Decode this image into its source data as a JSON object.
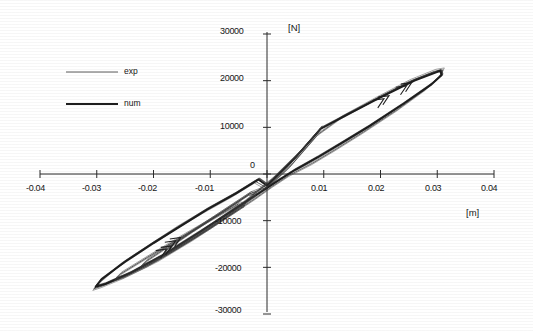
{
  "chart_data": {
    "type": "line",
    "title": "",
    "subtitle": "",
    "xlabel": "[m]",
    "ylabel": "[N]",
    "xlim": [
      -0.04,
      0.04
    ],
    "ylim": [
      -30000,
      30000
    ],
    "xticks": [
      -0.04,
      -0.03,
      -0.02,
      -0.01,
      0,
      0.01,
      0.02,
      0.03,
      0.04
    ],
    "xtick_labels": [
      "-0.04",
      "-0.03",
      "-0.02",
      "-0.01",
      "0",
      "0.01",
      "0.02",
      "0.03",
      "0.04"
    ],
    "yticks": [
      30000,
      20000,
      10000,
      0,
      -10000,
      -20000,
      -30000
    ],
    "ytick_labels": [
      "30000",
      "20000",
      "10000",
      "0",
      "-10000",
      "-20000",
      "-30000"
    ],
    "origin_label": "0",
    "grid": false,
    "legend_position": "upper-left",
    "axes_style": "centered-cross",
    "series": [
      {
        "name": "exp",
        "style": "thin",
        "color": "#4a4a4a",
        "points": [
          [
            0.0,
            -3000
          ],
          [
            0.004,
            1500
          ],
          [
            0.009,
            8500
          ],
          [
            0.013,
            12000
          ],
          [
            0.019,
            16000
          ],
          [
            0.025,
            19800
          ],
          [
            0.0295,
            22000
          ],
          [
            0.031,
            22300
          ],
          [
            0.0305,
            21000
          ],
          [
            0.028,
            18200
          ],
          [
            0.023,
            13800
          ],
          [
            0.017,
            9000
          ],
          [
            0.012,
            5200
          ],
          [
            0.008,
            2300
          ],
          [
            0.004,
            -200
          ],
          [
            0.001,
            -2600
          ],
          [
            -0.002,
            -5200
          ],
          [
            -0.007,
            -9200
          ],
          [
            -0.013,
            -14000
          ],
          [
            -0.019,
            -18400
          ],
          [
            -0.025,
            -22000
          ],
          [
            -0.029,
            -24000
          ],
          [
            -0.0305,
            -24600
          ],
          [
            -0.0295,
            -23200
          ],
          [
            -0.026,
            -19600
          ],
          [
            -0.021,
            -15600
          ],
          [
            -0.016,
            -11600
          ],
          [
            -0.011,
            -8000
          ],
          [
            -0.006,
            -4600
          ],
          [
            -0.002,
            -1600
          ],
          [
            0.0,
            -3000
          ]
        ]
      },
      {
        "name": "num",
        "style": "thick",
        "color": "#1e1e1e",
        "points": [
          [
            0.0,
            -2500
          ],
          [
            0.005,
            3500
          ],
          [
            0.0095,
            9700
          ],
          [
            0.014,
            12600
          ],
          [
            0.02,
            16400
          ],
          [
            0.026,
            20000
          ],
          [
            0.0305,
            22100
          ],
          [
            0.0308,
            21200
          ],
          [
            0.029,
            19200
          ],
          [
            0.024,
            15000
          ],
          [
            0.018,
            10200
          ],
          [
            0.013,
            6500
          ],
          [
            0.009,
            3600
          ],
          [
            0.005,
            900
          ],
          [
            0.002,
            -1400
          ],
          [
            -0.001,
            -3800
          ],
          [
            -0.006,
            -7800
          ],
          [
            -0.012,
            -12600
          ],
          [
            -0.018,
            -17200
          ],
          [
            -0.024,
            -21200
          ],
          [
            -0.0285,
            -23600
          ],
          [
            -0.0302,
            -24200
          ],
          [
            -0.0292,
            -22600
          ],
          [
            -0.025,
            -18800
          ],
          [
            -0.02,
            -14800
          ],
          [
            -0.015,
            -11000
          ],
          [
            -0.0105,
            -7600
          ],
          [
            -0.0055,
            -4200
          ],
          [
            -0.0015,
            -1200
          ],
          [
            0.0,
            -2500
          ]
        ]
      },
      {
        "name": "inner-loop-1",
        "style": "thin",
        "color": "#333333",
        "points": [
          [
            0.0,
            -2800
          ],
          [
            0.004,
            2000
          ],
          [
            0.0092,
            9400
          ],
          [
            0.0095,
            9900
          ],
          [
            0.006,
            5000
          ],
          [
            0.001,
            -1000
          ],
          [
            -0.004,
            -6000
          ],
          [
            -0.01,
            -11000
          ],
          [
            -0.0155,
            -15200
          ],
          [
            -0.0182,
            -17200
          ],
          [
            -0.0175,
            -16000
          ],
          [
            -0.013,
            -12200
          ],
          [
            -0.008,
            -8200
          ],
          [
            -0.003,
            -4200
          ],
          [
            0.0,
            -2800
          ]
        ]
      },
      {
        "name": "inner-loop-2",
        "style": "thin",
        "color": "#3a3a3a",
        "points": [
          [
            -0.002,
            -4600
          ],
          [
            -0.007,
            -9000
          ],
          [
            -0.012,
            -13000
          ],
          [
            -0.0168,
            -16600
          ],
          [
            -0.0205,
            -19000
          ],
          [
            -0.0222,
            -19800
          ],
          [
            -0.0212,
            -18600
          ],
          [
            -0.017,
            -15200
          ],
          [
            -0.012,
            -11400
          ],
          [
            -0.0075,
            -7800
          ],
          [
            -0.003,
            -4200
          ],
          [
            -0.002,
            -4600
          ]
        ]
      },
      {
        "name": "inner-loop-3",
        "style": "thin",
        "color": "#3a3a3a",
        "points": [
          [
            -0.004,
            -6800
          ],
          [
            -0.01,
            -11600
          ],
          [
            -0.016,
            -16000
          ],
          [
            -0.021,
            -19600
          ],
          [
            -0.0252,
            -22000
          ],
          [
            -0.0268,
            -22600
          ],
          [
            -0.0258,
            -21400
          ],
          [
            -0.021,
            -17800
          ],
          [
            -0.015,
            -13400
          ],
          [
            -0.009,
            -9200
          ],
          [
            -0.005,
            -6400
          ],
          [
            -0.004,
            -6800
          ]
        ]
      }
    ],
    "annotations": [
      {
        "type": "direction-arrow",
        "x": 0.0215,
        "y": 16800,
        "label": ""
      },
      {
        "type": "direction-arrow",
        "x": 0.0255,
        "y": 19600,
        "label": ""
      },
      {
        "type": "direction-arrow",
        "x": -0.0168,
        "y": -15400,
        "label": ""
      },
      {
        "type": "direction-arrow",
        "x": -0.0152,
        "y": -13600,
        "label": ""
      }
    ]
  },
  "legend": {
    "entries": [
      {
        "label": "exp",
        "style": "thin"
      },
      {
        "label": "num",
        "style": "thick"
      }
    ]
  },
  "axes": {
    "x_unit": "[m]",
    "y_unit": "[N]",
    "origin_zero": "0"
  }
}
